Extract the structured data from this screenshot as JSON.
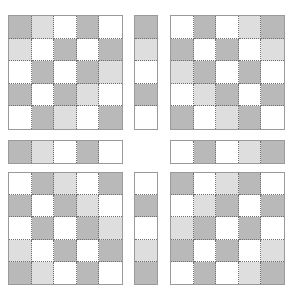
{
  "palette": {
    "D": "#b9b9b9",
    "L": "#dedede",
    "W": "#ffffff",
    "grid_line": "#6f6f6f",
    "border": "#9a9a9a"
  },
  "blocks": {
    "top_left_grid": {
      "rows": [
        [
          "D",
          "L",
          "W",
          "D",
          "W"
        ],
        [
          "L",
          "W",
          "D",
          "W",
          "D"
        ],
        [
          "W",
          "D",
          "W",
          "D",
          "L"
        ],
        [
          "D",
          "W",
          "D",
          "L",
          "W"
        ],
        [
          "W",
          "D",
          "L",
          "W",
          "D"
        ]
      ]
    },
    "top_column_strip": {
      "cells": [
        "D",
        "L",
        "W",
        "D",
        "W"
      ]
    },
    "top_right_grid": {
      "rows": [
        [
          "W",
          "D",
          "W",
          "L",
          "D"
        ],
        [
          "D",
          "W",
          "D",
          "W",
          "L"
        ],
        [
          "L",
          "D",
          "W",
          "D",
          "W"
        ],
        [
          "W",
          "L",
          "D",
          "W",
          "D"
        ],
        [
          "D",
          "W",
          "L",
          "D",
          "W"
        ]
      ]
    },
    "middle_left_row_strip": {
      "cells": [
        "D",
        "L",
        "W",
        "D",
        "W"
      ]
    },
    "middle_right_row_strip": {
      "cells": [
        "W",
        "D",
        "W",
        "L",
        "D"
      ]
    },
    "bottom_left_grid": {
      "rows": [
        [
          "W",
          "D",
          "L",
          "W",
          "D"
        ],
        [
          "D",
          "W",
          "D",
          "L",
          "W"
        ],
        [
          "W",
          "D",
          "W",
          "D",
          "L"
        ],
        [
          "L",
          "W",
          "D",
          "W",
          "D"
        ],
        [
          "D",
          "L",
          "W",
          "D",
          "W"
        ]
      ]
    },
    "bottom_column_strip": {
      "cells": [
        "W",
        "D",
        "W",
        "L",
        "D"
      ]
    },
    "bottom_right_grid": {
      "rows": [
        [
          "D",
          "W",
          "L",
          "D",
          "W"
        ],
        [
          "W",
          "L",
          "D",
          "W",
          "D"
        ],
        [
          "L",
          "D",
          "W",
          "D",
          "W"
        ],
        [
          "D",
          "W",
          "D",
          "W",
          "L"
        ],
        [
          "W",
          "D",
          "W",
          "L",
          "D"
        ]
      ]
    }
  }
}
